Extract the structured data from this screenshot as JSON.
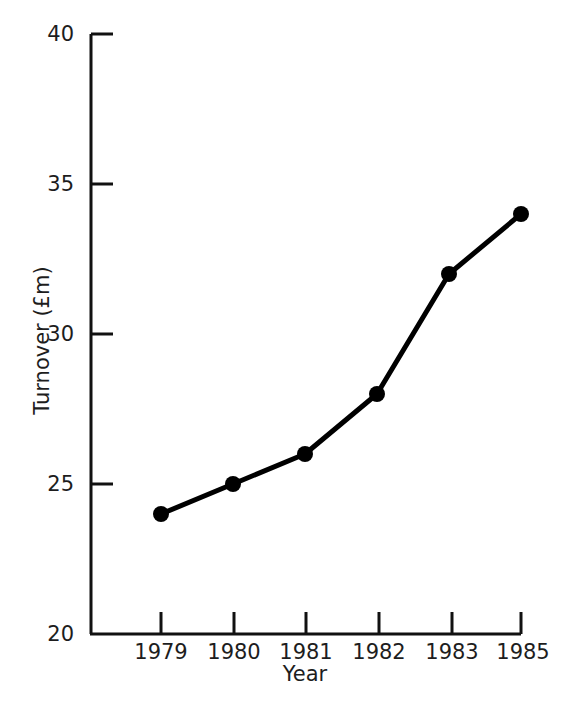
{
  "chart_data": {
    "type": "line",
    "title": "",
    "subtitle": "",
    "xlabel": "Year",
    "ylabel": "Turnover (£m)",
    "x": [
      1979,
      1980,
      1981,
      1982,
      1983,
      1985
    ],
    "categories": [
      "1979",
      "1980",
      "1981",
      "1982",
      "1983",
      "1985"
    ],
    "values": [
      24,
      25,
      26,
      28,
      32,
      34
    ],
    "series": [
      {
        "name": "Turnover",
        "values": [
          24,
          25,
          26,
          28,
          32,
          34
        ],
        "color": "#000000",
        "marker": "filled-circle"
      }
    ],
    "ylim": [
      20,
      40
    ],
    "yticks": [
      20,
      25,
      30,
      35,
      40
    ],
    "ytick_labels": [
      "20",
      "25",
      "30",
      "35",
      "40"
    ],
    "xtick_labels": [
      "1979",
      "1980",
      "1981",
      "1982",
      "1983",
      "1985"
    ],
    "grid": false,
    "legend": null,
    "legend_position": "none",
    "annotations": [],
    "axis_color": "#000000",
    "background_color": "#ffffff",
    "line_color": "#000000",
    "tick_direction": "out"
  },
  "axes": {
    "y": {
      "title": "Turnover (£m)",
      "ticks": [
        {
          "label": "40",
          "value": 40
        },
        {
          "label": "35",
          "value": 35
        },
        {
          "label": "30",
          "value": 30
        },
        {
          "label": "25",
          "value": 25
        },
        {
          "label": "20",
          "value": 20
        }
      ]
    },
    "x": {
      "title": "Year",
      "ticks": [
        {
          "label": "1979"
        },
        {
          "label": "1980"
        },
        {
          "label": "1981"
        },
        {
          "label": "1982"
        },
        {
          "label": "1983"
        },
        {
          "label": "1985"
        }
      ]
    }
  }
}
